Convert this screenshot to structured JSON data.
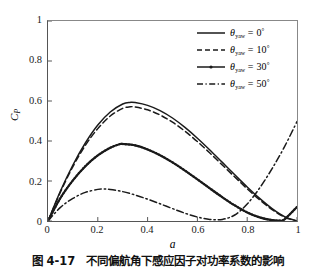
{
  "chart_data": {
    "type": "line",
    "title": "",
    "xlabel": "a",
    "ylabel": "C_P",
    "xlim": [
      0,
      1
    ],
    "ylim": [
      0,
      1
    ],
    "xticks": [
      "0",
      "0.2",
      "0.4",
      "0.6",
      "0.8",
      "1"
    ],
    "yticks": [
      "0",
      "0.2",
      "0.4",
      "0.6",
      "0.8",
      "1"
    ],
    "xtick_values": [
      0,
      0.2,
      0.4,
      0.6,
      0.8,
      1
    ],
    "ytick_values": [
      0,
      0.2,
      0.4,
      0.6,
      0.8,
      1
    ],
    "grid": false,
    "legend_position": "top-right",
    "series": [
      {
        "name": "theta_yaw = 0 deg",
        "label_symbol": "θ",
        "label_subscript": "yaw",
        "label_value": "0",
        "label_unit": "°",
        "style": "solid",
        "color": "#1a1a1a",
        "x": [
          0,
          0.05,
          0.1,
          0.15,
          0.2,
          0.25,
          0.3,
          0.33,
          0.35,
          0.4,
          0.45,
          0.5,
          0.55,
          0.6,
          0.65,
          0.7,
          0.75,
          0.8,
          0.85,
          0.9,
          0.95,
          1
        ],
        "y": [
          0,
          0.15,
          0.28,
          0.39,
          0.48,
          0.545,
          0.585,
          0.593,
          0.592,
          0.578,
          0.552,
          0.515,
          0.468,
          0.414,
          0.355,
          0.293,
          0.231,
          0.17,
          0.113,
          0.062,
          0.022,
          0
        ]
      },
      {
        "name": "theta_yaw = 10 deg",
        "label_symbol": "θ",
        "label_subscript": "yaw",
        "label_value": "10",
        "label_unit": "°",
        "style": "dashed",
        "color": "#1a1a1a",
        "x": [
          0,
          0.05,
          0.1,
          0.15,
          0.2,
          0.25,
          0.3,
          0.33,
          0.35,
          0.4,
          0.45,
          0.5,
          0.55,
          0.6,
          0.65,
          0.7,
          0.75,
          0.8,
          0.85,
          0.9,
          0.95,
          1
        ],
        "y": [
          0,
          0.145,
          0.272,
          0.378,
          0.462,
          0.525,
          0.563,
          0.571,
          0.57,
          0.556,
          0.53,
          0.494,
          0.449,
          0.397,
          0.34,
          0.28,
          0.22,
          0.161,
          0.106,
          0.057,
          0.019,
          0
        ]
      },
      {
        "name": "theta_yaw = 30 deg",
        "label_symbol": "θ",
        "label_subscript": "yaw",
        "label_value": "30",
        "label_unit": "°",
        "style": "solid-marker",
        "color": "#1a1a1a",
        "x": [
          0,
          0.05,
          0.1,
          0.15,
          0.2,
          0.25,
          0.29,
          0.3,
          0.35,
          0.4,
          0.45,
          0.5,
          0.55,
          0.6,
          0.65,
          0.7,
          0.75,
          0.8,
          0.85,
          0.9,
          0.93,
          0.95,
          1
        ],
        "y": [
          0,
          0.115,
          0.203,
          0.274,
          0.328,
          0.366,
          0.385,
          0.385,
          0.378,
          0.358,
          0.329,
          0.293,
          0.252,
          0.208,
          0.163,
          0.119,
          0.078,
          0.043,
          0.018,
          0.004,
          0.002,
          0.008,
          0.07
        ]
      },
      {
        "name": "theta_yaw = 50 deg",
        "label_symbol": "θ",
        "label_subscript": "yaw",
        "label_value": "50",
        "label_unit": "°",
        "style": "dash-dot",
        "color": "#1a1a1a",
        "x": [
          0,
          0.05,
          0.1,
          0.15,
          0.2,
          0.22,
          0.25,
          0.3,
          0.35,
          0.4,
          0.45,
          0.5,
          0.55,
          0.6,
          0.65,
          0.7,
          0.75,
          0.8,
          0.85,
          0.9,
          0.95,
          1
        ],
        "y": [
          0,
          0.068,
          0.113,
          0.143,
          0.158,
          0.16,
          0.158,
          0.147,
          0.13,
          0.109,
          0.086,
          0.062,
          0.039,
          0.02,
          0.008,
          0.008,
          0.03,
          0.085,
          0.165,
          0.262,
          0.372,
          0.497
        ]
      }
    ]
  },
  "axes": {
    "ylabel_symbol": "C",
    "ylabel_subscript": "P",
    "xlabel_symbol": "a"
  },
  "caption": {
    "text": "图 4-17　不同偏航角下感应因子对功率系数的影响"
  }
}
